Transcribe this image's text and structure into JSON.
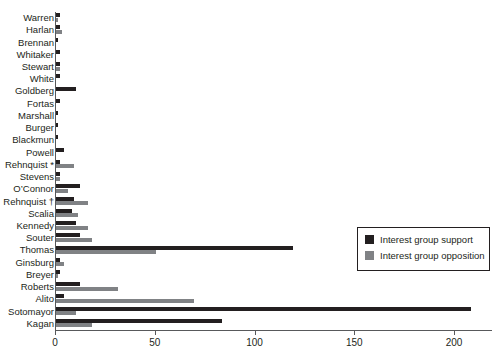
{
  "chart_data": {
    "type": "bar",
    "orientation": "horizontal",
    "title": "",
    "xlabel": "",
    "ylabel": "",
    "xlim": [
      0,
      219
    ],
    "xticks": [
      0,
      50,
      100,
      150,
      200
    ],
    "xtick_labels": [
      "0",
      "50",
      "100",
      "150",
      "200"
    ],
    "grid": false,
    "legend_position": "center right",
    "categories": [
      "Warren",
      "Harlan",
      "Brennan",
      "Whitaker",
      "Stewart",
      "White",
      "Goldberg",
      "Fortas",
      "Marshall",
      "Burger",
      "Blackmun",
      "Powell",
      "Rehnquist *",
      "Stevens",
      "O’Connor",
      "Rehnquist †",
      "Scalia",
      "Kennedy",
      "Souter",
      "Thomas",
      "Ginsburg",
      "Breyer",
      "Roberts",
      "Alito",
      "Sotomayor",
      "Kagan"
    ],
    "series": [
      {
        "name": "Interest group support",
        "color": "#231f20",
        "values": [
          2,
          2,
          1,
          2,
          2,
          2,
          10,
          2,
          1,
          1,
          1,
          4,
          2,
          2,
          12,
          9,
          8,
          10,
          12,
          119,
          2,
          2,
          12,
          4,
          208,
          83
        ]
      },
      {
        "name": "Interest group opposition",
        "color": "#808285",
        "values": [
          1,
          3,
          0,
          0,
          2,
          0,
          0,
          0,
          0,
          0,
          0,
          0,
          9,
          2,
          6,
          16,
          11,
          16,
          18,
          50,
          4,
          1,
          31,
          69,
          10,
          18
        ]
      }
    ]
  },
  "legend": {
    "items": [
      {
        "label": "Interest group support",
        "swatch": "dark-square-swatch"
      },
      {
        "label": "Interest group opposition",
        "swatch": "gray-square-swatch"
      }
    ]
  }
}
